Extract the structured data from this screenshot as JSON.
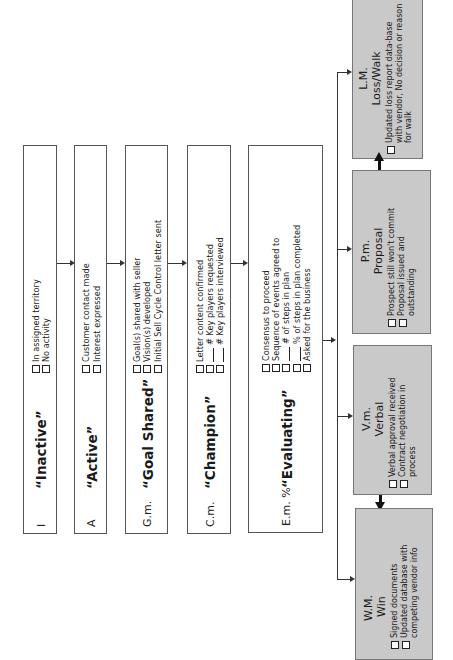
{
  "stages": [
    {
      "code": "I",
      "title": "“Inactive”",
      "items": [
        {
          "check": true,
          "blank": false,
          "text": "In assigned territory"
        },
        {
          "check": true,
          "blank": false,
          "text": "No activity"
        }
      ]
    },
    {
      "code": "A",
      "title": "“Active”",
      "items": [
        {
          "check": true,
          "blank": false,
          "text": "Customer contact made"
        },
        {
          "check": true,
          "blank": false,
          "text": "Interest expressed"
        }
      ]
    },
    {
      "code": "G.m.",
      "title": "“Goal Shared”",
      "items": [
        {
          "check": true,
          "blank": false,
          "text": "Goal(s) shared with seller"
        },
        {
          "check": true,
          "blank": false,
          "text": "Vision(s) developed"
        },
        {
          "check": true,
          "blank": false,
          "text": "Initial Sell Cycle Control letter sent"
        }
      ]
    },
    {
      "code": "C.m.",
      "title": "“Champion”",
      "items": [
        {
          "check": true,
          "blank": false,
          "text": "Letter content confirmed"
        },
        {
          "check": true,
          "blank": true,
          "text": "# Key players requested"
        },
        {
          "check": true,
          "blank": true,
          "text": "# Key players interviewed"
        }
      ]
    },
    {
      "code": "E.m. %",
      "title": "“Evaluating”",
      "items": [
        {
          "check": true,
          "blank": false,
          "text": "Consensus to proceed"
        },
        {
          "check": true,
          "blank": false,
          "text": "Sequence of events agreed to"
        },
        {
          "check": true,
          "blank": true,
          "text": "# of steps in plan"
        },
        {
          "check": true,
          "blank": true,
          "text": "% of steps in plan completed"
        },
        {
          "check": true,
          "blank": false,
          "text": "Asked for the business"
        }
      ]
    }
  ],
  "outcomes": [
    {
      "code": "L.M.",
      "title": "Loss/Walk",
      "items": [
        {
          "text": "Updated loss report data-base with vendor, No decision or reason for walk"
        }
      ]
    },
    {
      "code": "P.m.",
      "title": "Proposal",
      "items": [
        {
          "text": "Prospect still won't commit"
        },
        {
          "text": "Proposal issued and outstanding"
        }
      ]
    },
    {
      "code": "V.m.",
      "title": "Verbal",
      "items": [
        {
          "text": "Verbal approval received"
        },
        {
          "text": "Contract negotiation in process"
        }
      ]
    },
    {
      "code": "W.M.",
      "title": "Win",
      "items": [
        {
          "text": "Signed documents"
        },
        {
          "text": "Updated database with competing vendor info"
        }
      ]
    }
  ],
  "colors": {
    "outcome_fill": "#c9c9c9",
    "stage_fill": "#ffffff",
    "line": "#333333"
  }
}
